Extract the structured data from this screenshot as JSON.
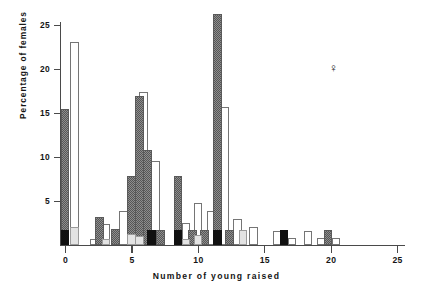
{
  "figure": {
    "female_symbol": "♀"
  },
  "chart_data": {
    "type": "bar",
    "title": "",
    "xlabel": "Number of young raised",
    "ylabel": "Percentage of females",
    "xlim": [
      -0.6,
      26.0
    ],
    "ylim": [
      0,
      27
    ],
    "xticks": [
      0,
      5,
      10,
      15,
      20,
      25
    ],
    "yticks": [
      5,
      10,
      15,
      20,
      25
    ],
    "xtick_labels": [
      "0",
      "5",
      "10",
      "15",
      "20",
      "25"
    ],
    "ytick_labels": [
      "5",
      "10",
      "15",
      "20",
      "25"
    ],
    "grid": false,
    "legend_position": "none",
    "annotations": [
      {
        "text": "♀",
        "x": 20.1,
        "y": 20.5
      }
    ],
    "series": [
      {
        "name": "black",
        "fill": "solid-black",
        "color": "#111111",
        "x": [
          0,
          6.5,
          8.5,
          11.5,
          16.5
        ],
        "values": [
          1.7,
          1.7,
          1.7,
          1.7,
          1.7
        ]
      },
      {
        "name": "dark-hatched",
        "fill": "dark-crosshatch",
        "color": "#8e8e8e",
        "x": [
          0,
          2.6,
          3.8,
          5.0,
          5.6,
          6.2,
          7.2,
          8.5,
          9.6,
          10.5,
          11.5,
          12.4,
          13.4,
          19.8
        ],
        "values": [
          15.5,
          3.2,
          1.8,
          7.8,
          16.9,
          10.8,
          1.7,
          7.8,
          1.7,
          1.7,
          26.3,
          1.7,
          1.7,
          1.7
        ]
      },
      {
        "name": "white-open",
        "fill": "open-white",
        "color": "#ffffff",
        "x": [
          0.7,
          2.2,
          3.1,
          4.4,
          5.9,
          6.8,
          9.1,
          10.0,
          11.0,
          12.0,
          13.0,
          14.2,
          16.0,
          17.1,
          18.3,
          19.3,
          20.4
        ],
        "values": [
          23.1,
          0.7,
          2.4,
          3.9,
          17.4,
          9.5,
          2.5,
          4.8,
          3.9,
          15.7,
          3.0,
          2.0,
          1.6,
          0.8,
          1.6,
          0.8,
          0.8
        ]
      },
      {
        "name": "light-gray",
        "fill": "light-gray",
        "color": "#e3e3e3",
        "x": [
          0.7,
          3.1,
          5.0,
          5.6,
          9.1,
          10.0,
          13.4
        ],
        "values": [
          2.0,
          0.7,
          1.2,
          1.0,
          0.7,
          1.1,
          1.7
        ]
      }
    ]
  }
}
